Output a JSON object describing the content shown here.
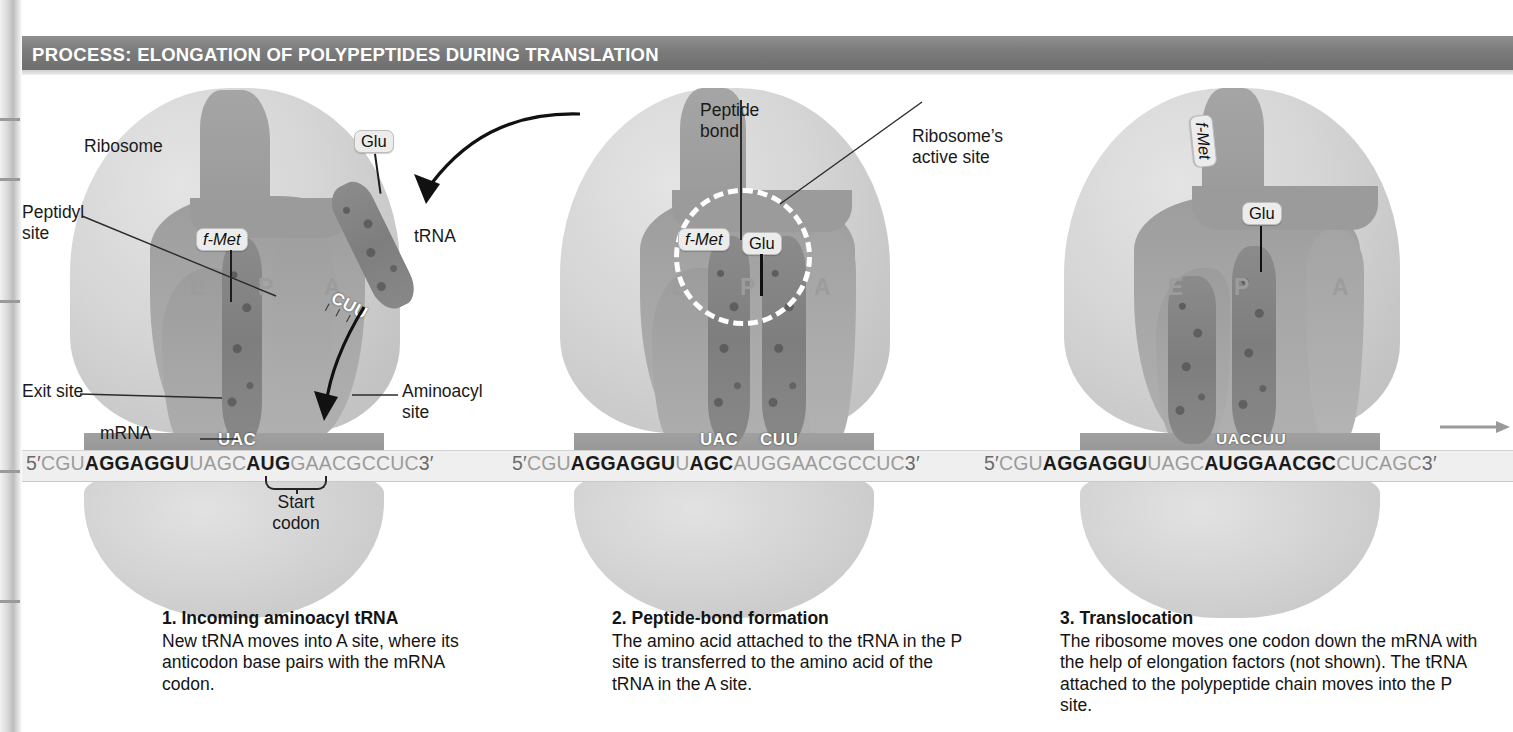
{
  "header": {
    "lead": "PROCESS:",
    "title": "ELONGATION OF POLYPEPTIDES DURING TRANSLATION",
    "full": "PROCESS: ELONGATION OF POLYPEPTIDES DURING TRANSLATION",
    "bar_color": "#7b7b7b",
    "text_color": "#ffffff"
  },
  "colors": {
    "ribosome_light": "#d5d5d5",
    "ribosome_cleft": "#a3a3a3",
    "trna": "#868686",
    "mrna_band": "#efefef",
    "mrna_bold": "#1b1b1b",
    "mrna_dim": "#9b9b9b",
    "active_site_ring": "#ffffff",
    "tag_fill": "#ececec"
  },
  "panel1": {
    "labels": {
      "ribosome": "Ribosome",
      "peptidyl_site": "Peptidyl\nsite",
      "exit_site": "Exit site",
      "aminoacyl_site": "Aminoacyl site",
      "trna": "tRNA",
      "mrna": "mRNA",
      "start_codon": "Start\ncodon"
    },
    "sites": {
      "e": "E",
      "p": "P",
      "a": "A"
    },
    "tags": {
      "fmet": "f-Met",
      "glu": "Glu"
    },
    "anticodons": {
      "p_site": "UAC",
      "incoming": "CUU"
    },
    "mrna": {
      "five_prime": "5′",
      "three_prime": "3′",
      "segments": [
        {
          "text": "CGU",
          "bold": false
        },
        {
          "text": "AGGAGGU",
          "bold": true
        },
        {
          "text": "UAGC",
          "bold": false
        },
        {
          "text": "AUG",
          "bold": true
        },
        {
          "text": "GAACGCCUC",
          "bold": false
        }
      ],
      "full": "5′ CGUAGGAGGUUAGCAUGGAACGCCUC 3′"
    },
    "caption": {
      "number_title": "1. Incoming aminoacyl tRNA",
      "body": "New tRNA moves into A site, where its anticodon base pairs with the mRNA codon."
    }
  },
  "panel2": {
    "labels": {
      "peptide_bond": "Peptide\nbond",
      "ribosome_active_site": "Ribosome’s\nactive site"
    },
    "sites": {
      "e": "E",
      "p": "P",
      "a": "A"
    },
    "tags": {
      "fmet": "f-Met",
      "glu": "Glu"
    },
    "anticodons": {
      "p_site": "UAC",
      "a_site": "CUU"
    },
    "mrna": {
      "five_prime": "5′",
      "three_prime": "3′",
      "segments": [
        {
          "text": "CGU",
          "bold": false
        },
        {
          "text": "AGGAGGU",
          "bold": true
        },
        {
          "text": "U",
          "bold": false
        },
        {
          "text": "AGC",
          "bold": true
        },
        {
          "text": "AUGG",
          "bold": false
        },
        {
          "text": "AA",
          "bold": false
        },
        {
          "text": "CGCCUC",
          "bold": false
        }
      ],
      "full": "5′ CGUAGGAGGUUAGCAUGGAACGCCUC 3′"
    },
    "caption": {
      "number_title": "2. Peptide-bond formation",
      "body": "The amino acid attached to the tRNA in the P site is transferred to the amino acid of the tRNA in the A site."
    }
  },
  "panel3": {
    "sites": {
      "e": "E",
      "p": "P",
      "a": "A"
    },
    "tags": {
      "fmet": "f-Met",
      "glu": "Glu"
    },
    "anticodons": {
      "combined": "UACCUU"
    },
    "mrna": {
      "five_prime": "5′",
      "three_prime": "3′",
      "segments": [
        {
          "text": "CGU",
          "bold": false
        },
        {
          "text": "AGGAGGU",
          "bold": true
        },
        {
          "text": "UAGC",
          "bold": false
        },
        {
          "text": "AUGGAA",
          "bold": true
        },
        {
          "text": "CGC",
          "bold": true
        },
        {
          "text": "CUCAGC",
          "bold": false
        }
      ],
      "full": "5′ CGUAGGAGGUUAGCAUGGAACGCCUCAGC 3′"
    },
    "caption": {
      "number_title": "3. Translocation",
      "body": "The ribosome moves one codon down the mRNA with the help of elongation factors (not shown). The tRNA attached to the polypeptide chain moves into the P site."
    },
    "translocation_arrow": "right-arrow"
  }
}
